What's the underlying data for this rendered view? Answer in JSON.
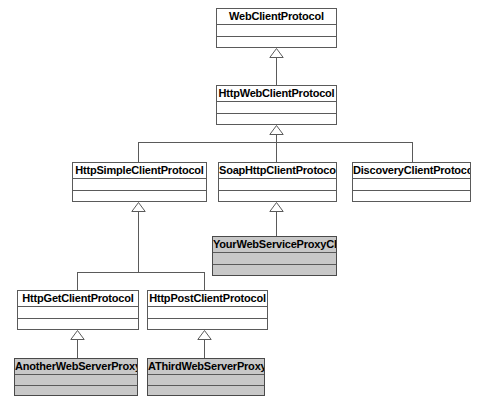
{
  "diagram": {
    "type": "uml-class-diagram",
    "colors": {
      "background": "#ffffff",
      "box_fill": "#ffffff",
      "user_class_fill": "#c8c8c8",
      "line": "#5a5a5a",
      "text": "#000000"
    },
    "relationship_type": "generalization",
    "classes": [
      {
        "id": "web-client-protocol",
        "name": "WebClientProtocol",
        "fill": "white",
        "x": 216,
        "y": 8,
        "w": 121,
        "h": 40
      },
      {
        "id": "http-web-client-protocol",
        "name": "HttpWebClientProtocol",
        "fill": "white",
        "x": 216,
        "y": 85,
        "w": 121,
        "h": 40
      },
      {
        "id": "http-simple-client-protocol",
        "name": "HttpSimpleClientProtocol",
        "fill": "white",
        "x": 72,
        "y": 162,
        "w": 135,
        "h": 40
      },
      {
        "id": "soap-http-client-protocol",
        "name": "SoapHttpClientProtocol",
        "fill": "white",
        "x": 218,
        "y": 162,
        "w": 119,
        "h": 40
      },
      {
        "id": "discovery-client-protocol",
        "name": "DiscoveryClientProtocol",
        "fill": "white",
        "x": 352,
        "y": 162,
        "w": 119,
        "h": 40
      },
      {
        "id": "your-web-service-proxy-class",
        "name": "YourWebServiceProxyClass",
        "fill": "shaded",
        "x": 212,
        "y": 236,
        "w": 125,
        "h": 40
      },
      {
        "id": "http-get-client-protocol",
        "name": "HttpGetClientProtocol",
        "fill": "white",
        "x": 17,
        "y": 290,
        "w": 122,
        "h": 40
      },
      {
        "id": "http-post-client-protocol",
        "name": "HttpPostClientProtocol",
        "fill": "white",
        "x": 147,
        "y": 290,
        "w": 121,
        "h": 40
      },
      {
        "id": "another-web-server-proxy",
        "name": "AnotherWebServerProxy",
        "fill": "shaded",
        "x": 14,
        "y": 358,
        "w": 124,
        "h": 38
      },
      {
        "id": "a-third-web-server-proxy",
        "name": "AThirdWebServerProxy",
        "fill": "shaded",
        "x": 147,
        "y": 358,
        "w": 118,
        "h": 38
      }
    ],
    "generalizations": [
      {
        "child": "http-web-client-protocol",
        "parent": "web-client-protocol"
      },
      {
        "child": "http-simple-client-protocol",
        "parent": "http-web-client-protocol"
      },
      {
        "child": "soap-http-client-protocol",
        "parent": "http-web-client-protocol"
      },
      {
        "child": "discovery-client-protocol",
        "parent": "http-web-client-protocol"
      },
      {
        "child": "your-web-service-proxy-class",
        "parent": "soap-http-client-protocol"
      },
      {
        "child": "http-get-client-protocol",
        "parent": "http-simple-client-protocol"
      },
      {
        "child": "http-post-client-protocol",
        "parent": "http-simple-client-protocol"
      },
      {
        "child": "another-web-server-proxy",
        "parent": "http-get-client-protocol"
      },
      {
        "child": "a-third-web-server-proxy",
        "parent": "http-post-client-protocol"
      }
    ]
  }
}
